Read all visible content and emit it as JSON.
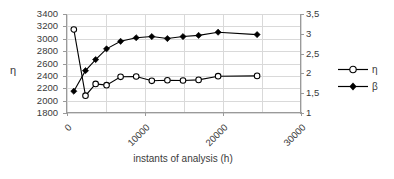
{
  "chart_data": {
    "type": "line",
    "title": "",
    "xlabel": "instants of analysis (h)",
    "ylabel": "η",
    "ylabel_right": "",
    "xlim": [
      0,
      30000
    ],
    "ylim": [
      1800,
      3400
    ],
    "ylim_right": [
      1,
      3.5
    ],
    "grid": true,
    "legend_position": "right",
    "x_ticks": [
      0,
      10000,
      20000,
      30000
    ],
    "x_tick_labels": [
      "0",
      "10000",
      "20000",
      "30000"
    ],
    "x_gridlines": [
      0,
      5000,
      10000,
      15000,
      20000,
      25000,
      30000
    ],
    "y_ticks_left": [
      1800,
      2000,
      2200,
      2400,
      2600,
      2800,
      3000,
      3200,
      3400
    ],
    "y_tick_labels_left": [
      "1800",
      "2000",
      "2200",
      "2400",
      "2600",
      "2800",
      "3000",
      "3200",
      "3400"
    ],
    "y_ticks_right": [
      1,
      1.5,
      2,
      2.5,
      3,
      3.5
    ],
    "y_tick_labels_right": [
      "1",
      "1,5",
      "2",
      "2,5",
      "3",
      "3,5"
    ],
    "series": [
      {
        "name": "η",
        "axis": "left",
        "marker": "open-circle",
        "color": "#000000",
        "x": [
          1000,
          2500,
          3800,
          5200,
          7000,
          9000,
          11000,
          13000,
          15000,
          17000,
          19500,
          24500
        ],
        "values": [
          3150,
          2080,
          2270,
          2250,
          2385,
          2390,
          2320,
          2330,
          2325,
          2335,
          2395,
          2400
        ]
      },
      {
        "name": "β",
        "axis": "right",
        "marker": "filled-diamond",
        "color": "#000000",
        "x": [
          1000,
          2500,
          3800,
          5200,
          7000,
          9000,
          11000,
          13000,
          15000,
          17000,
          19500,
          24500
        ],
        "values": [
          1.55,
          2.07,
          2.35,
          2.62,
          2.81,
          2.9,
          2.93,
          2.88,
          2.93,
          2.96,
          3.04,
          2.98
        ]
      }
    ]
  },
  "legend": {
    "items": [
      {
        "label": "η",
        "marker": "open-circle"
      },
      {
        "label": "β",
        "marker": "filled-diamond"
      }
    ]
  },
  "axis_titles": {
    "y_left": "η",
    "x": "instants of analysis (h)"
  },
  "colors": {
    "axis": "#9a9a9a",
    "grid": "#d9d9d9",
    "text": "#3a3a3a",
    "series": "#000000"
  }
}
